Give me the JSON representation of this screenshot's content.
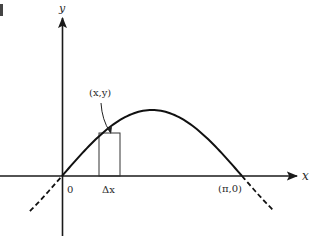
{
  "figure": {
    "type": "function-graph",
    "function": "y = sin x",
    "axes": {
      "x_label": "x",
      "y_label": "y",
      "origin_label": "0"
    },
    "labels": {
      "point": "(x,y)",
      "delta": "Δx",
      "root": "(π,0)"
    },
    "domain_solid": [
      0,
      3.14159
    ],
    "dashed_extensions": [
      "x < 0",
      "x > π"
    ],
    "strip": {
      "description": "vertical rectangle of width Δx under the curve",
      "height_reaches": "(x,y)"
    },
    "colors": {
      "ink": "#1a1a1a",
      "background": "#ffffff"
    }
  }
}
